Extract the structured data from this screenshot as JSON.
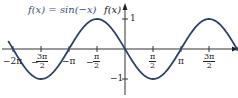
{
  "chart_data": {
    "type": "line",
    "title": "f(x) = sin(−x)",
    "xlabel": "",
    "ylabel": "f(x)",
    "xlim": [
      -6.55,
      6.55
    ],
    "ylim": [
      -1,
      1
    ],
    "x_ticks": [
      "−2π",
      "−3π/2",
      "−π",
      "−π/2",
      "π/2",
      "π",
      "3π/2"
    ],
    "y_ticks": [
      "1",
      "−1"
    ],
    "series": [
      {
        "name": "f(x) = sin(−x)",
        "color": "#2e3f6e",
        "x": [
          -6.283,
          -4.712,
          -3.142,
          -1.571,
          0,
          1.571,
          3.142,
          4.712,
          6.283
        ],
        "values": [
          0,
          -1,
          0,
          1,
          0,
          -1,
          0,
          1,
          0
        ]
      }
    ],
    "grid": false,
    "legend": "none"
  },
  "labels": {
    "title": "f(x) = sin(−x)",
    "ylabel": "f(x)",
    "y_one": "1",
    "y_neg_one": "−1",
    "neg_two_pi": "−2π",
    "neg_three_pi_num": "3π",
    "neg_three_pi_den": "2",
    "neg_pi": "−π",
    "neg_half_pi_num": "π",
    "neg_half_pi_den": "2",
    "half_pi_num": "π",
    "half_pi_den": "2",
    "pi": "π",
    "three_half_pi_num": "3π",
    "three_half_pi_den": "2",
    "minus": "−"
  }
}
